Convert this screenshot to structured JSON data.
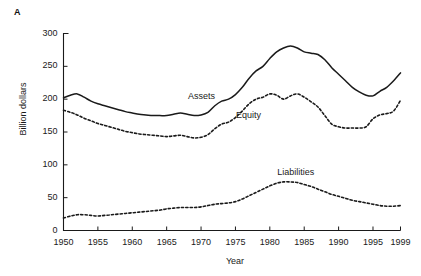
{
  "panel": {
    "label": "A"
  },
  "top_caption": {
    "text": ""
  },
  "chart_data": {
    "type": "line",
    "title": "",
    "subtitle": "",
    "xlabel": "Year",
    "ylabel": "Billion dollars",
    "xlim": [
      1950,
      1999
    ],
    "ylim": [
      0,
      300
    ],
    "yticks": [
      0,
      50,
      100,
      150,
      200,
      250,
      300
    ],
    "xticks": [
      1950,
      1955,
      1960,
      1965,
      1970,
      1975,
      1980,
      1985,
      1990,
      1995,
      1999
    ],
    "grid": false,
    "legend_position": "inline-annotations",
    "annotations": [
      {
        "text": "Assets",
        "x": 1971,
        "y": 204
      },
      {
        "text": "Equity",
        "x": 1978,
        "y": 174
      },
      {
        "text": "Liabilities",
        "x": 1984,
        "y": 88
      }
    ],
    "x": [
      1950,
      1951,
      1952,
      1953,
      1954,
      1955,
      1956,
      1957,
      1958,
      1959,
      1960,
      1961,
      1962,
      1963,
      1964,
      1965,
      1966,
      1967,
      1968,
      1969,
      1970,
      1971,
      1972,
      1973,
      1974,
      1975,
      1976,
      1977,
      1978,
      1979,
      1980,
      1981,
      1982,
      1983,
      1984,
      1985,
      1986,
      1987,
      1988,
      1989,
      1990,
      1991,
      1992,
      1993,
      1994,
      1995,
      1996,
      1997,
      1998,
      1999
    ],
    "series": [
      {
        "name": "Assets",
        "style": "solid",
        "color": "#1a1a1a",
        "values": [
          202,
          206,
          208,
          204,
          199,
          195,
          192,
          189,
          186,
          183,
          180,
          178,
          176,
          175,
          175,
          175,
          176,
          178,
          177,
          176,
          177,
          181,
          190,
          196,
          199,
          205,
          215,
          228,
          240,
          248,
          258,
          266,
          272,
          279,
          281,
          277,
          274,
          273,
          268,
          256,
          248,
          238,
          228,
          219,
          214,
          209,
          205,
          208,
          216,
          218
        ],
        "x_note": "Peak near 1984 at 281; trough near 1994 at 205"
      },
      {
        "name": "Equity",
        "style": "dotted",
        "color": "#1a1a1a",
        "values": [
          183,
          180,
          176,
          172,
          168,
          164,
          161,
          158,
          155,
          152,
          149,
          147,
          145,
          144,
          143,
          142,
          141,
          141,
          141,
          141,
          143,
          147,
          153,
          158,
          160,
          165,
          172,
          180,
          186,
          189,
          194,
          198,
          199,
          200,
          201,
          197,
          193,
          192,
          189,
          178,
          170,
          162,
          157,
          155,
          155,
          155,
          157,
          170,
          175,
          175
        ],
        "x_note": "dotted curve below Assets"
      },
      {
        "name": "Liabilities",
        "style": "dotted",
        "color": "#1a1a1a",
        "values": [
          19,
          22,
          24,
          24,
          23,
          22,
          23,
          24,
          25,
          26,
          27,
          28,
          29,
          30,
          31,
          33,
          34,
          36,
          36,
          36,
          37,
          39,
          41,
          42,
          43,
          45,
          48,
          52,
          57,
          62,
          66,
          70,
          73,
          74,
          74,
          73,
          70,
          67,
          64,
          61,
          58,
          55,
          52,
          50,
          48,
          46,
          44,
          42,
          41,
          40
        ],
        "x_note": "lower dotted curve"
      }
    ]
  },
  "series_curves": {
    "assets": [
      [
        1950,
        202
      ],
      [
        1951,
        206
      ],
      [
        1952,
        208
      ],
      [
        1953,
        203
      ],
      [
        1954,
        197
      ],
      [
        1955,
        193
      ],
      [
        1956,
        190
      ],
      [
        1957,
        187
      ],
      [
        1958,
        184
      ],
      [
        1959,
        181
      ],
      [
        1960,
        179
      ],
      [
        1961,
        177
      ],
      [
        1962,
        176
      ],
      [
        1963,
        175
      ],
      [
        1964,
        175
      ],
      [
        1965,
        175
      ],
      [
        1966,
        177
      ],
      [
        1967,
        179
      ],
      [
        1968,
        177
      ],
      [
        1969,
        175
      ],
      [
        1970,
        176
      ],
      [
        1971,
        180
      ],
      [
        1972,
        190
      ],
      [
        1973,
        197
      ],
      [
        1974,
        200
      ],
      [
        1975,
        207
      ],
      [
        1976,
        218
      ],
      [
        1977,
        232
      ],
      [
        1978,
        243
      ],
      [
        1979,
        250
      ],
      [
        1980,
        262
      ],
      [
        1981,
        272
      ],
      [
        1982,
        278
      ],
      [
        1983,
        281
      ],
      [
        1984,
        278
      ],
      [
        1985,
        272
      ],
      [
        1986,
        270
      ],
      [
        1987,
        268
      ],
      [
        1988,
        260
      ],
      [
        1989,
        248
      ],
      [
        1990,
        238
      ],
      [
        1991,
        228
      ],
      [
        1992,
        218
      ],
      [
        1993,
        211
      ],
      [
        1994,
        206
      ],
      [
        1995,
        205
      ],
      [
        1996,
        212
      ],
      [
        1997,
        218
      ],
      [
        1998,
        228
      ],
      [
        1999,
        240
      ]
    ],
    "equity": [
      [
        1950,
        183
      ],
      [
        1951,
        180
      ],
      [
        1952,
        176
      ],
      [
        1953,
        171
      ],
      [
        1954,
        167
      ],
      [
        1955,
        163
      ],
      [
        1956,
        160
      ],
      [
        1957,
        157
      ],
      [
        1958,
        154
      ],
      [
        1959,
        151
      ],
      [
        1960,
        149
      ],
      [
        1961,
        147
      ],
      [
        1962,
        146
      ],
      [
        1963,
        145
      ],
      [
        1964,
        144
      ],
      [
        1965,
        143
      ],
      [
        1966,
        144
      ],
      [
        1967,
        145
      ],
      [
        1968,
        143
      ],
      [
        1969,
        141
      ],
      [
        1970,
        142
      ],
      [
        1971,
        146
      ],
      [
        1972,
        155
      ],
      [
        1973,
        162
      ],
      [
        1974,
        165
      ],
      [
        1975,
        172
      ],
      [
        1976,
        182
      ],
      [
        1977,
        193
      ],
      [
        1978,
        200
      ],
      [
        1979,
        203
      ],
      [
        1980,
        208
      ],
      [
        1981,
        206
      ],
      [
        1982,
        200
      ],
      [
        1983,
        205
      ],
      [
        1984,
        208
      ],
      [
        1985,
        203
      ],
      [
        1986,
        196
      ],
      [
        1987,
        188
      ],
      [
        1988,
        175
      ],
      [
        1989,
        162
      ],
      [
        1990,
        158
      ],
      [
        1991,
        156
      ],
      [
        1992,
        156
      ],
      [
        1993,
        156
      ],
      [
        1994,
        158
      ],
      [
        1995,
        170
      ],
      [
        1996,
        176
      ],
      [
        1997,
        178
      ],
      [
        1998,
        182
      ],
      [
        1999,
        198
      ]
    ],
    "liabilities": [
      [
        1950,
        19
      ],
      [
        1951,
        22
      ],
      [
        1952,
        24
      ],
      [
        1953,
        24
      ],
      [
        1954,
        23
      ],
      [
        1955,
        22
      ],
      [
        1956,
        23
      ],
      [
        1957,
        24
      ],
      [
        1958,
        25
      ],
      [
        1959,
        26
      ],
      [
        1960,
        27
      ],
      [
        1961,
        28
      ],
      [
        1962,
        29
      ],
      [
        1963,
        30
      ],
      [
        1964,
        31
      ],
      [
        1965,
        33
      ],
      [
        1966,
        34
      ],
      [
        1967,
        35
      ],
      [
        1968,
        35
      ],
      [
        1969,
        35
      ],
      [
        1970,
        36
      ],
      [
        1971,
        38
      ],
      [
        1972,
        40
      ],
      [
        1973,
        41
      ],
      [
        1974,
        42
      ],
      [
        1975,
        44
      ],
      [
        1976,
        48
      ],
      [
        1977,
        53
      ],
      [
        1978,
        58
      ],
      [
        1979,
        63
      ],
      [
        1980,
        68
      ],
      [
        1981,
        72
      ],
      [
        1982,
        74
      ],
      [
        1983,
        74
      ],
      [
        1984,
        73
      ],
      [
        1985,
        70
      ],
      [
        1986,
        67
      ],
      [
        1987,
        63
      ],
      [
        1988,
        59
      ],
      [
        1989,
        55
      ],
      [
        1990,
        52
      ],
      [
        1991,
        49
      ],
      [
        1992,
        46
      ],
      [
        1993,
        44
      ],
      [
        1994,
        42
      ],
      [
        1995,
        40
      ],
      [
        1996,
        38
      ],
      [
        1997,
        37
      ],
      [
        1998,
        37
      ],
      [
        1999,
        38
      ]
    ]
  }
}
